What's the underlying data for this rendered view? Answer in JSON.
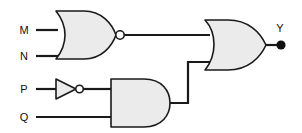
{
  "diagram": {
    "background_color": "#ffffff",
    "line_color": "#1a1a1a",
    "gate_fill_color": "#ebebeb",
    "terminal_color": "#111111"
  },
  "inputs": [
    {
      "id": "M",
      "label": "M",
      "x": 24,
      "y": 30
    },
    {
      "id": "N",
      "label": "N",
      "x": 24,
      "y": 56
    },
    {
      "id": "P",
      "label": "P",
      "x": 24,
      "y": 89
    },
    {
      "id": "Q",
      "label": "Q",
      "x": 24,
      "y": 117
    }
  ],
  "outputs": [
    {
      "id": "Y",
      "label": "Y",
      "x": 277,
      "y": 32
    }
  ],
  "gates": [
    {
      "id": "gate-nor-1",
      "type": "NOR",
      "label": "NOR",
      "inputs": [
        "M",
        "N"
      ],
      "output": "nor_out",
      "inverted_output": true
    },
    {
      "id": "gate-not-1",
      "type": "NOT",
      "label": "NOT",
      "inputs": [
        "P"
      ],
      "output": "p_not",
      "inverted_output": true
    },
    {
      "id": "gate-and-1",
      "type": "AND",
      "label": "AND",
      "inputs": [
        "p_not",
        "Q"
      ],
      "output": "and_out",
      "inverted_output": false
    },
    {
      "id": "gate-or-1",
      "type": "OR",
      "label": "OR",
      "inputs": [
        "nor_out",
        "and_out"
      ],
      "output": "Y",
      "inverted_output": false
    }
  ],
  "expression": "Y = (M + N)' + (P' . Q)"
}
